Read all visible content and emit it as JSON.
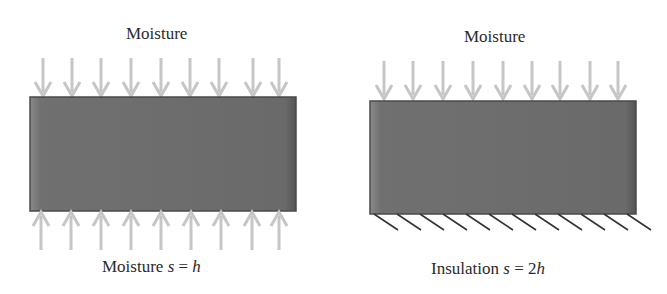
{
  "left_panel": {
    "top_label": "Moisture",
    "bottom_label_text": "Moisture ",
    "bottom_label_var": "s",
    "bottom_label_eq": " = ",
    "bottom_label_val": "h",
    "top_arrows": 9,
    "bottom_arrows": 9,
    "bottom_boundary": "moisture"
  },
  "right_panel": {
    "top_label": "Moisture",
    "bottom_label_text": "Insulation ",
    "bottom_label_var": "s",
    "bottom_label_eq": " = 2",
    "bottom_label_val": "h",
    "top_arrows": 9,
    "hatch_lines": 12,
    "bottom_boundary": "insulation"
  },
  "colors": {
    "slab": "#6e6e6e",
    "slab_edge": "#4a4a4a",
    "arrow": "#c4c4c4",
    "hatch": "#333333",
    "text": "#2a2a2a"
  }
}
